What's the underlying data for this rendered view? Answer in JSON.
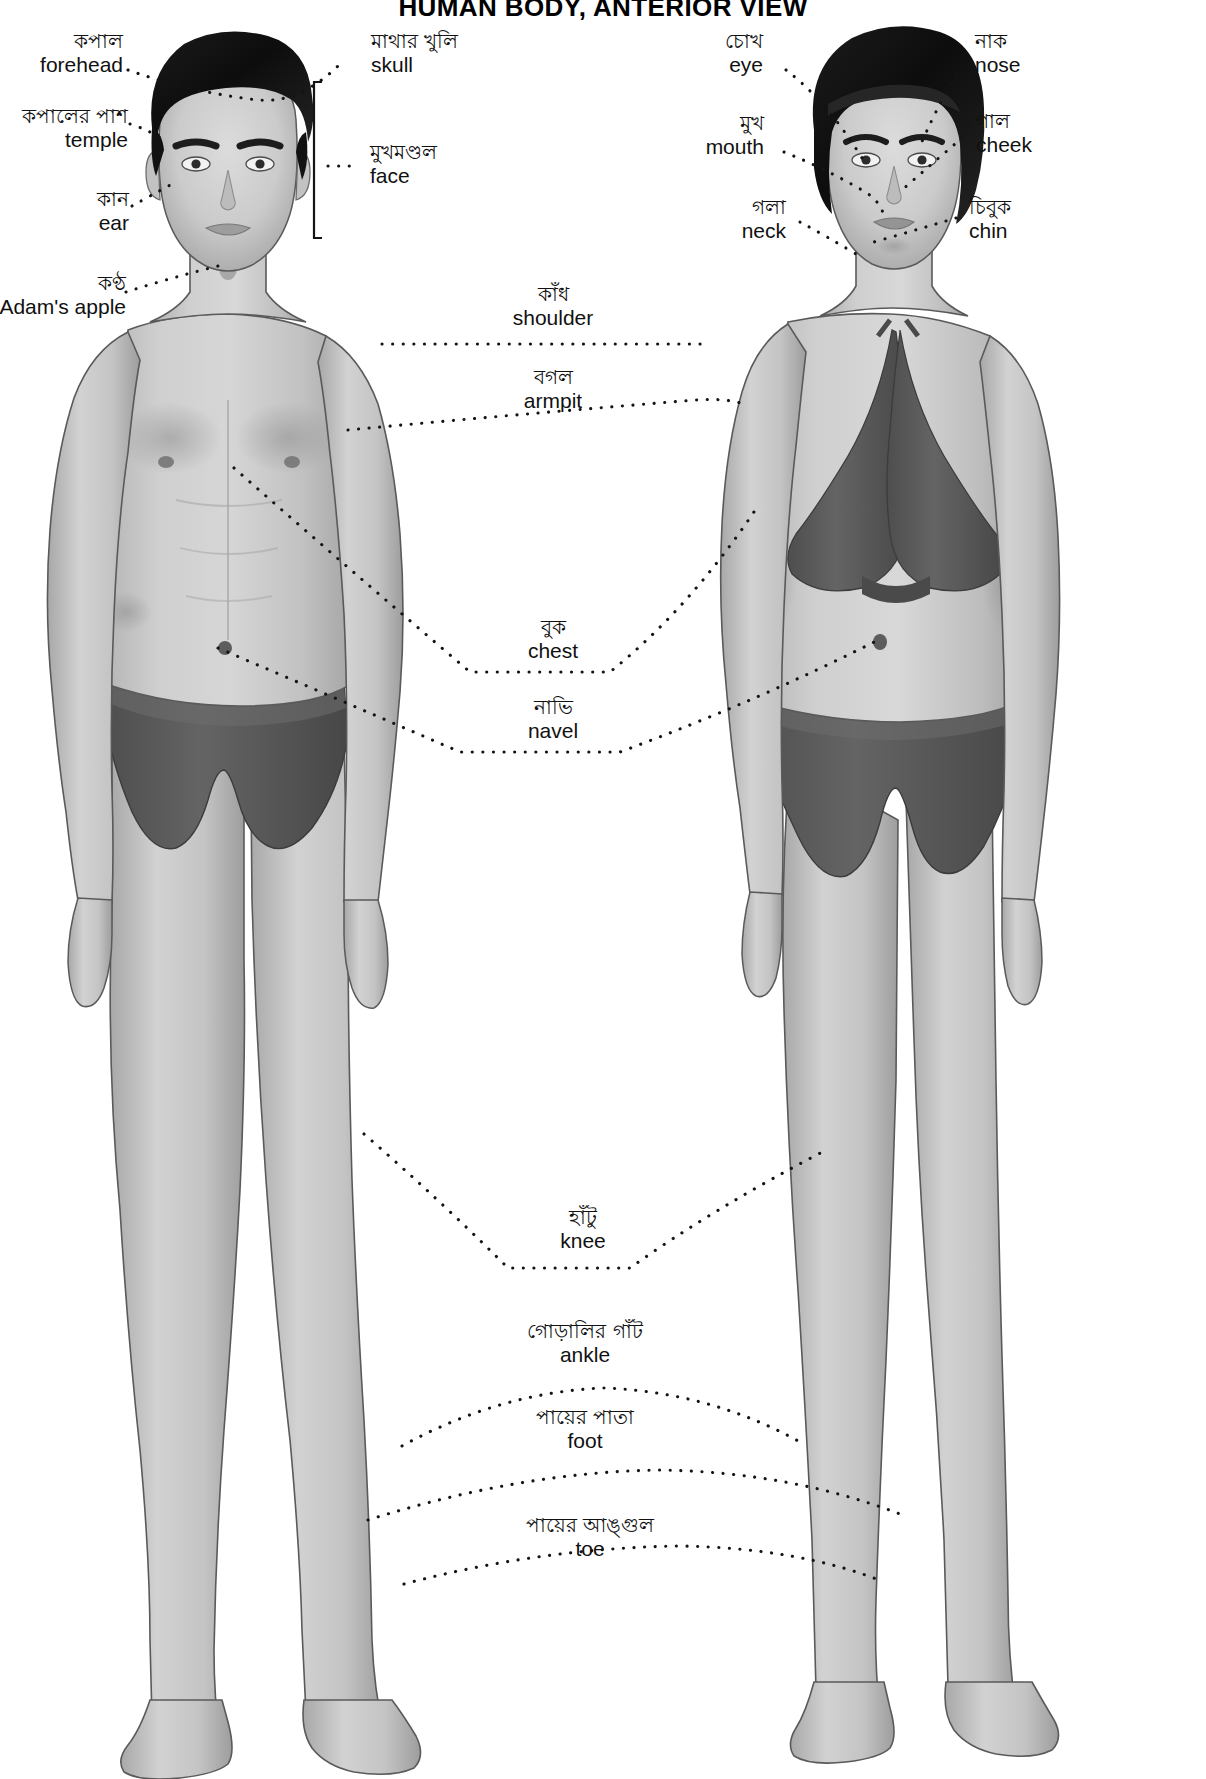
{
  "title": "HUMAN BODY, ANTERIOR VIEW",
  "figures": {
    "left": "male-figure-anterior",
    "right": "female-figure-anterior"
  },
  "colors": {
    "skin_light": "#d3d3d3",
    "skin_mid": "#bdbdbd",
    "skin_shadow": "#9e9e9e",
    "hair": "#141414",
    "garment": "#5a5a5a",
    "garment_dark": "#4a4a4a",
    "outline": "#4a4a4a",
    "leader": "#141414",
    "text": "#111111",
    "background": "#ffffff"
  },
  "labels": {
    "left_column": [
      {
        "bn": "কপাল",
        "en": "forehead",
        "name": "forehead"
      },
      {
        "bn": "কপালের পাশ",
        "en": "temple",
        "name": "temple"
      },
      {
        "bn": "কান",
        "en": "ear",
        "name": "ear"
      },
      {
        "bn": "কণ্ঠ",
        "en": "Adam's apple",
        "name": "adams-apple"
      }
    ],
    "left_inner_column": [
      {
        "bn": "মাথার খুলি",
        "en": "skull",
        "name": "skull"
      },
      {
        "bn": "মুখমণ্ডল",
        "en": "face",
        "name": "face"
      }
    ],
    "center_column": [
      {
        "bn": "কাঁধ",
        "en": "shoulder",
        "name": "shoulder"
      },
      {
        "bn": "বগল",
        "en": "armpit",
        "name": "armpit"
      },
      {
        "bn": "বুক",
        "en": "chest",
        "name": "chest"
      },
      {
        "bn": "নাভি",
        "en": "navel",
        "name": "navel"
      },
      {
        "bn": "হাঁটু",
        "en": "knee",
        "name": "knee"
      },
      {
        "bn": "গোড়ালির গাঁট",
        "en": "ankle",
        "name": "ankle"
      },
      {
        "bn": "পায়ের পাতা",
        "en": "foot",
        "name": "foot"
      },
      {
        "bn": "পায়ের আঙ্গুল",
        "en": "toe",
        "name": "toe"
      }
    ],
    "right_inner_column": [
      {
        "bn": "চোখ",
        "en": "eye",
        "name": "eye"
      },
      {
        "bn": "মুখ",
        "en": "mouth",
        "name": "mouth"
      },
      {
        "bn": "গলা",
        "en": "neck",
        "name": "neck"
      }
    ],
    "right_column": [
      {
        "bn": "নাক",
        "en": "nose",
        "name": "nose"
      },
      {
        "bn": "গাল",
        "en": "cheek",
        "name": "cheek"
      },
      {
        "bn": "চিবুক",
        "en": "chin",
        "name": "chin"
      }
    ]
  }
}
